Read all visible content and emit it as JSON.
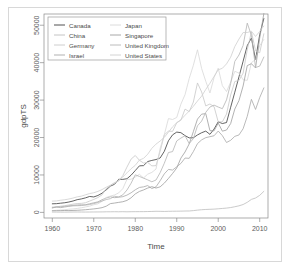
{
  "figure": {
    "background_color": "#ffffff",
    "frame_color": "#d8d8d8"
  },
  "chart_data": {
    "type": "line",
    "title": "",
    "xlabel": "Time",
    "ylabel": "gdpTS",
    "xlim": [
      1958,
      2012
    ],
    "ylim": [
      -1500,
      53000
    ],
    "xticks": [
      1960,
      1970,
      1980,
      1990,
      2000,
      2010
    ],
    "yticks": [
      0,
      10000,
      20000,
      30000,
      40000,
      50000
    ],
    "ytick_labels": [
      "0",
      "10000",
      "20000",
      "30000",
      "40000",
      "50000"
    ],
    "xtick_labels": [
      "1960",
      "1970",
      "1980",
      "1990",
      "2000",
      "2010"
    ],
    "grid": false,
    "legend_position": "top-left",
    "legend_columns": 2,
    "x": [
      1960,
      1961,
      1962,
      1963,
      1964,
      1965,
      1966,
      1967,
      1968,
      1969,
      1970,
      1971,
      1972,
      1973,
      1974,
      1975,
      1976,
      1977,
      1978,
      1979,
      1980,
      1981,
      1982,
      1983,
      1984,
      1985,
      1986,
      1987,
      1988,
      1989,
      1990,
      1991,
      1992,
      1993,
      1994,
      1995,
      1996,
      1997,
      1998,
      1999,
      2000,
      2001,
      2002,
      2003,
      2004,
      2005,
      2006,
      2007,
      2008,
      2009,
      2010,
      2011
    ],
    "series": [
      {
        "name": "Canada",
        "color": "#3c3c3c",
        "values": [
          2294,
          2332,
          2455,
          2576,
          2775,
          3045,
          3399,
          3595,
          3877,
          4255,
          4121,
          4519,
          5127,
          6007,
          7011,
          7508,
          8838,
          8822,
          8991,
          9936,
          11170,
          12426,
          12495,
          13580,
          13884,
          14114,
          14534,
          16309,
          19136,
          20716,
          21449,
          21296,
          20507,
          19903,
          19935,
          20687,
          21283,
          21712,
          20852,
          22267,
          24190,
          23736,
          24004,
          28091,
          32105,
          36223,
          40386,
          44544,
          46596,
          40764,
          47447,
          51791
        ]
      },
      {
        "name": "China",
        "color": "#bdbdbd",
        "values": [
          89,
          75,
          70,
          73,
          84,
          97,
          103,
          95,
          90,
          99,
          111,
          117,
          128,
          155,
          159,
          176,
          163,
          182,
          156,
          181,
          194,
          197,
          203,
          225,
          250,
          294,
          281,
          252,
          284,
          310,
          317,
          333,
          366,
          377,
          473,
          609,
          709,
          781,
          821,
          873,
          959,
          1053,
          1148,
          1289,
          1509,
          1753,
          2099,
          2695,
          3471,
          3838,
          4550,
          5618
        ]
      },
      {
        "name": "Germany",
        "color": "#c8c8c8",
        "values": [
          1172,
          1476,
          1652,
          1783,
          1991,
          2196,
          2358,
          2402,
          2570,
          3017,
          3458,
          3965,
          4702,
          6335,
          7193,
          7960,
          8362,
          9819,
          12100,
          14240,
          15200,
          13920,
          13180,
          13350,
          12430,
          12480,
          16360,
          20710,
          21710,
          21640,
          23950,
          24620,
          27600,
          26920,
          29450,
          34580,
          32170,
          28440,
          28960,
          28250,
          24170,
          24190,
          26280,
          31350,
          34960,
          35230,
          37210,
          43450,
          48220,
          43180,
          42650,
          47730
        ]
      },
      {
        "name": "Israel",
        "color": "#a8a8a8",
        "values": [
          1229,
          1434,
          1275,
          1446,
          1624,
          1754,
          1785,
          1822,
          2043,
          2299,
          2556,
          2817,
          3370,
          3849,
          4174,
          3930,
          4052,
          4197,
          4618,
          5238,
          6035,
          6661,
          6819,
          7159,
          6368,
          6823,
          8459,
          10290,
          11480,
          11310,
          12180,
          13080,
          14520,
          14440,
          16230,
          18370,
          19370,
          19970,
          20220,
          20470,
          21730,
          20500,
          18670,
          19260,
          20320,
          20680,
          22350,
          25660,
          30200,
          27500,
          30660,
          33260
        ]
      },
      {
        "name": "Japan",
        "color": "#d8d8d8",
        "values": [
          479,
          563,
          633,
          717,
          835,
          920,
          1058,
          1227,
          1450,
          1669,
          2038,
          2272,
          2966,
          3975,
          4354,
          4659,
          5199,
          6335,
          8821,
          8856,
          9463,
          10170,
          9198,
          10210,
          10680,
          11580,
          17110,
          20760,
          25060,
          24810,
          25360,
          28910,
          31460,
          35770,
          39270,
          43440,
          38440,
          35020,
          31900,
          36030,
          38530,
          33850,
          32290,
          34800,
          37690,
          37220,
          35430,
          35280,
          39990,
          40850,
          44510,
          46200
        ]
      },
      {
        "name": "Singapore",
        "color": "#9e9e9e",
        "values": [
          428,
          449,
          472,
          511,
          483,
          516,
          566,
          628,
          713,
          814,
          926,
          1071,
          1264,
          1654,
          2345,
          2490,
          2674,
          2843,
          3194,
          3900,
          4928,
          5597,
          6000,
          6500,
          6870,
          6500,
          6830,
          7810,
          9070,
          10400,
          11860,
          14500,
          16140,
          18290,
          21560,
          24920,
          26240,
          26380,
          21830,
          21800,
          23850,
          21700,
          22000,
          23730,
          27610,
          29870,
          33770,
          39220,
          39720,
          38580,
          46570,
          53120
        ]
      },
      {
        "name": "United Kingdom",
        "color": "#b4b4b4",
        "values": [
          1380,
          1452,
          1514,
          1613,
          1748,
          1873,
          1986,
          2059,
          1952,
          2100,
          2348,
          2650,
          3030,
          3426,
          3665,
          4300,
          4136,
          4683,
          5976,
          7804,
          10030,
          9600,
          9150,
          8690,
          8180,
          8650,
          10610,
          13120,
          15990,
          16240,
          19090,
          19850,
          20480,
          18390,
          19700,
          23120,
          24390,
          26730,
          28140,
          28660,
          28150,
          27700,
          30060,
          34420,
          40350,
          42040,
          44600,
          50570,
          47290,
          38710,
          39080,
          41510
        ]
      },
      {
        "name": "United States",
        "color": "#cfcfcf",
        "values": [
          3007,
          3067,
          3244,
          3375,
          3574,
          3828,
          4146,
          4336,
          4696,
          5032,
          5247,
          5609,
          6094,
          6726,
          7226,
          7801,
          8592,
          9453,
          10560,
          11670,
          12570,
          13980,
          14430,
          15540,
          17120,
          18240,
          19070,
          20040,
          21420,
          22860,
          23950,
          24750,
          25950,
          27060,
          28350,
          29750,
          31050,
          32850,
          34500,
          36330,
          38090,
          38490,
          39680,
          41470,
          44310,
          46300,
          48050,
          48060,
          48400,
          47000,
          48370,
          49790
        ]
      }
    ]
  },
  "legend": {
    "items": [
      {
        "label": "Canada",
        "color": "#3c3c3c"
      },
      {
        "label": "Japan",
        "color": "#d8d8d8"
      },
      {
        "label": "China",
        "color": "#bdbdbd"
      },
      {
        "label": "Singapore",
        "color": "#9e9e9e"
      },
      {
        "label": "Germany",
        "color": "#c8c8c8"
      },
      {
        "label": "United Kingdom",
        "color": "#b4b4b4"
      },
      {
        "label": "Israel",
        "color": "#a8a8a8"
      },
      {
        "label": "United States",
        "color": "#cfcfcf"
      }
    ]
  }
}
